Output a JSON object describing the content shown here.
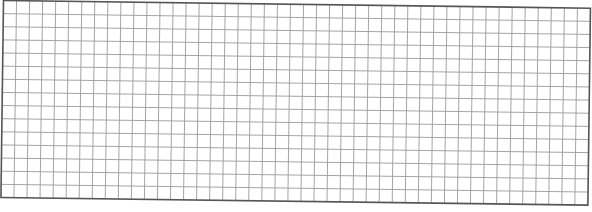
{
  "grid": {
    "columns": 45,
    "rows": 15,
    "cell_size": 13.1,
    "line_color": "#9a9a9a",
    "border_color": "#555555",
    "background": "#ffffff",
    "rotation_deg": 0.75,
    "origin": [
      3.5,
      0.5
    ],
    "width": 587,
    "height": 197
  }
}
